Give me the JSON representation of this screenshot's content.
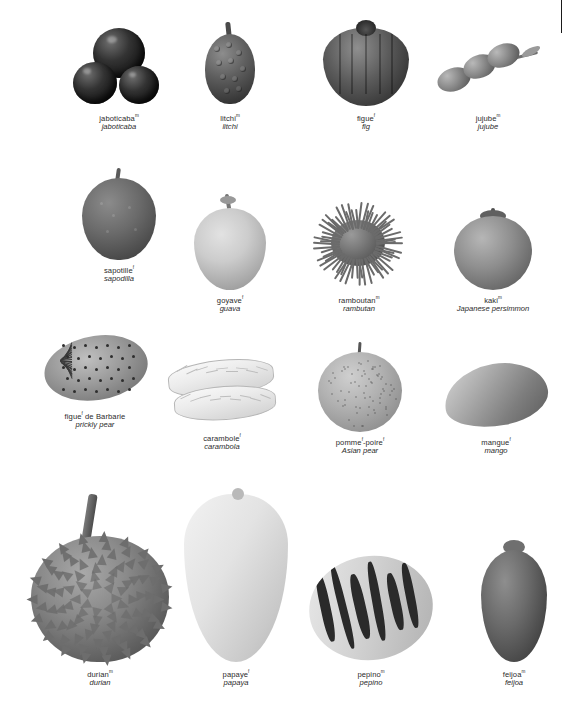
{
  "page": {
    "language_primary": "French",
    "language_secondary": "English",
    "background_color": "#ffffff",
    "text_color": "#2b2b2b"
  },
  "rows": [
    {
      "items": [
        {
          "fr": "jaboticaba",
          "gender": "m",
          "en": "jaboticaba",
          "icon": "jaboticaba-fruit"
        },
        {
          "fr": "litchi",
          "gender": "m",
          "en": "litchi",
          "icon": "litchi-fruit"
        },
        {
          "fr": "figue",
          "gender": "f",
          "en": "fig",
          "icon": "fig-fruit"
        },
        {
          "fr": "jujube",
          "gender": "m",
          "en": "jujube",
          "icon": "jujube-fruit"
        }
      ]
    },
    {
      "items": [
        {
          "fr": "sapotille",
          "gender": "f",
          "en": "sapodilla",
          "icon": "sapodilla-fruit"
        },
        {
          "fr": "goyave",
          "gender": "f",
          "en": "guava",
          "icon": "guava-fruit"
        },
        {
          "fr": "ramboutan",
          "gender": "m",
          "en": "rambutan",
          "icon": "rambutan-fruit"
        },
        {
          "fr": "kaki",
          "gender": "m",
          "en": "Japanese persimmon",
          "icon": "persimmon-fruit"
        }
      ]
    },
    {
      "items": [
        {
          "fr": "figue",
          "gender": "f",
          "fr_suffix": " de Barbarie",
          "en": "prickly pear",
          "icon": "prickly-pear-fruit"
        },
        {
          "fr": "carambole",
          "gender": "f",
          "en": "carambola",
          "icon": "carambola-fruit"
        },
        {
          "fr": "pomme",
          "gender": "f",
          "fr_suffix": "-poire",
          "gender2": "f",
          "en": "Asian pear",
          "icon": "asian-pear-fruit"
        },
        {
          "fr": "mangue",
          "gender": "f",
          "en": "mango",
          "icon": "mango-fruit"
        }
      ]
    },
    {
      "items": [
        {
          "fr": "durian",
          "gender": "m",
          "en": "durian",
          "icon": "durian-fruit"
        },
        {
          "fr": "papaye",
          "gender": "f",
          "en": "papaya",
          "icon": "papaya-fruit"
        },
        {
          "fr": "pepino",
          "gender": "m",
          "en": "pepino",
          "icon": "pepino-fruit"
        },
        {
          "fr": "feijoa",
          "gender": "m",
          "en": "feijoa",
          "icon": "feijoa-fruit"
        }
      ]
    }
  ]
}
